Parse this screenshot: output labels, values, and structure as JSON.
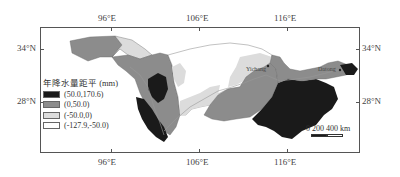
{
  "map": {
    "legend": {
      "title": "年降水量距平 (mm)",
      "items": [
        {
          "label": "(50.0,170.6)",
          "color": "#1a1a1a"
        },
        {
          "label": "(0,50.0)",
          "color": "#8c8c8c"
        },
        {
          "label": "(-50.0,0)",
          "color": "#dcdcdc"
        },
        {
          "label": "(-127.9,-50.0)",
          "color": "#ffffff"
        }
      ]
    },
    "axes": {
      "top_ticks": [
        "96°E",
        "106°E",
        "116°E"
      ],
      "bottom_ticks": [
        "96°E",
        "106°E",
        "116°E"
      ],
      "left_ticks": [
        "34°N",
        "28°N"
      ],
      "right_ticks": [
        "34°N",
        "28°N"
      ]
    },
    "cities": [
      {
        "name": "Yichang"
      },
      {
        "name": "Datong"
      }
    ],
    "scale_bar": {
      "labels": "0  200 400 km"
    }
  }
}
